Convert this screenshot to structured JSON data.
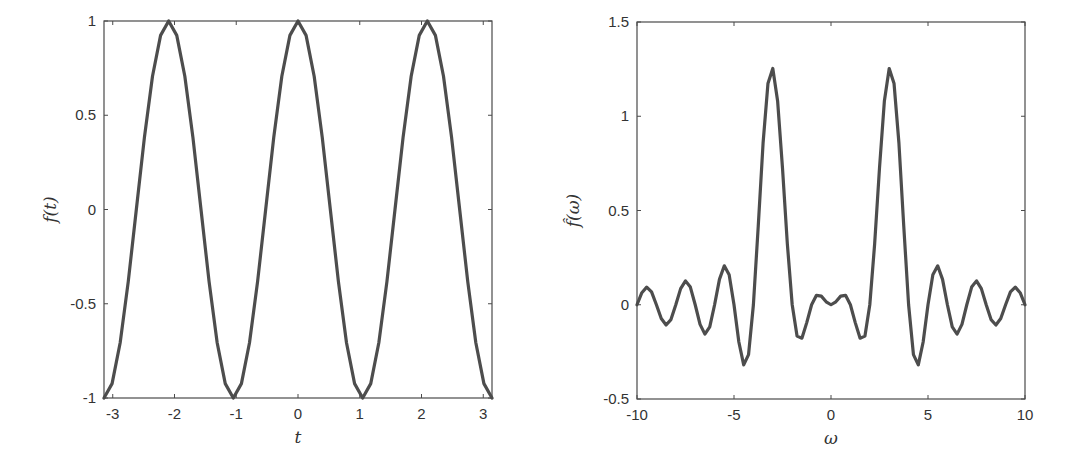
{
  "chart_data": [
    {
      "type": "line",
      "title": "",
      "xlabel": "t",
      "ylabel": "f(t)",
      "xlim": [
        -3.14159,
        3.14159
      ],
      "ylim": [
        -1,
        1
      ],
      "grid": false,
      "xticks": [
        -3,
        -2,
        -1,
        0,
        1,
        2,
        3
      ],
      "xtick_labels": [
        "-3",
        "-2",
        "-1",
        "0",
        "1",
        "2",
        "3"
      ],
      "yticks": [
        -1,
        -0.5,
        0,
        0.5,
        1
      ],
      "ytick_labels": [
        "-1",
        "-0.5",
        "0",
        "0.5",
        "1"
      ],
      "series": [
        {
          "name": "f(t) = cos(3t)",
          "color": "#4d4d4d",
          "x": [
            -3.1416,
            -3.0107,
            -2.8798,
            -2.7489,
            -2.618,
            -2.4871,
            -2.3562,
            -2.2253,
            -2.0944,
            -1.9635,
            -1.8326,
            -1.7017,
            -1.5708,
            -1.4399,
            -1.309,
            -1.1781,
            -1.0472,
            -0.9163,
            -0.7854,
            -0.6545,
            -0.5236,
            -0.3927,
            -0.2618,
            -0.1309,
            0.0,
            0.1309,
            0.2618,
            0.3927,
            0.5236,
            0.6545,
            0.7854,
            0.9163,
            1.0472,
            1.1781,
            1.309,
            1.4399,
            1.5708,
            1.7017,
            1.8326,
            1.9635,
            2.0944,
            2.2253,
            2.3562,
            2.4871,
            2.618,
            2.7489,
            2.8798,
            3.0107,
            3.1416
          ],
          "values": [
            -1,
            -0.9239,
            -0.7071,
            -0.3827,
            0,
            0.3827,
            0.7071,
            0.9239,
            1,
            0.9239,
            0.7071,
            0.3827,
            0,
            -0.3827,
            -0.7071,
            -0.9239,
            -1,
            -0.9239,
            -0.7071,
            -0.3827,
            0,
            0.3827,
            0.7071,
            0.9239,
            1,
            0.9239,
            0.7071,
            0.3827,
            0,
            -0.3827,
            -0.7071,
            -0.9239,
            -1,
            -0.9239,
            -0.7071,
            -0.3827,
            0,
            0.3827,
            0.7071,
            0.9239,
            1,
            0.9239,
            0.7071,
            0.3827,
            0,
            -0.3827,
            -0.7071,
            -0.9239,
            -1
          ]
        }
      ]
    },
    {
      "type": "line",
      "title": "",
      "xlabel": "ω",
      "ylabel": "f̂(ω)",
      "xlim": [
        -10,
        10
      ],
      "ylim": [
        -0.5,
        1.5
      ],
      "grid": false,
      "xticks": [
        -10,
        -5,
        0,
        5,
        10
      ],
      "xtick_labels": [
        "-10",
        "-5",
        "0",
        "5",
        "10"
      ],
      "yticks": [
        -0.5,
        0,
        0.5,
        1,
        1.5
      ],
      "ytick_labels": [
        "-0.5",
        "0",
        "0.5",
        "1",
        "1.5"
      ],
      "series": [
        {
          "name": "Fourier transform f̂(ω)",
          "color": "#4d4d4d",
          "x": [
            -10,
            -9.75,
            -9.5,
            -9.25,
            -9,
            -8.75,
            -8.5,
            -8.25,
            -8,
            -7.75,
            -7.5,
            -7.25,
            -7,
            -6.75,
            -6.5,
            -6.25,
            -6,
            -5.75,
            -5.5,
            -5.25,
            -5,
            -4.75,
            -4.5,
            -4.25,
            -4,
            -3.75,
            -3.5,
            -3.25,
            -3,
            -2.75,
            -2.5,
            -2.25,
            -2,
            -1.75,
            -1.5,
            -1.25,
            -1,
            -0.75,
            -0.5,
            -0.25,
            0,
            0.25,
            0.5,
            0.75,
            1,
            1.25,
            1.5,
            1.75,
            2,
            2.25,
            2.5,
            2.75,
            3,
            3.25,
            3.5,
            3.75,
            4,
            4.25,
            4.5,
            4.75,
            5,
            5.25,
            5.5,
            5.75,
            6,
            6.25,
            6.5,
            6.75,
            7,
            7.25,
            7.5,
            7.75,
            8,
            8.25,
            8.5,
            8.75,
            9,
            9.25,
            9.5,
            9.75,
            10
          ],
          "values": [
            0,
            0.0639,
            0.0933,
            0.0682,
            0,
            -0.0731,
            -0.1072,
            -0.0788,
            0,
            0.0856,
            0.1267,
            0.0939,
            0,
            -0.1042,
            -0.156,
            -0.1173,
            0,
            0.1348,
            0.2065,
            0.1596,
            0,
            -0.1976,
            -0.3191,
            -0.2646,
            0,
            0.4179,
            0.8594,
            1.1736,
            1.2533,
            1.0794,
            0.7254,
            0.3224,
            0,
            -0.1663,
            -0.1773,
            -0.0948,
            0,
            0.0501,
            0.0456,
            0.0158,
            0,
            0.0158,
            0.0456,
            0.0501,
            0,
            -0.0948,
            -0.1773,
            -0.1663,
            0,
            0.3224,
            0.7254,
            1.0794,
            1.2533,
            1.1736,
            0.8594,
            0.4179,
            0,
            -0.2646,
            -0.3191,
            -0.1976,
            0,
            0.1596,
            0.2065,
            0.1348,
            0,
            -0.1173,
            -0.156,
            -0.1042,
            0,
            0.0939,
            0.1267,
            0.0856,
            0,
            -0.0788,
            -0.1072,
            -0.0731,
            0,
            0.0682,
            0.0933,
            0.0639,
            0
          ]
        }
      ]
    }
  ],
  "layout": {
    "panels": [
      {
        "left": 104,
        "top": 21,
        "right": 492,
        "bottom": 398
      },
      {
        "left": 637,
        "top": 22,
        "right": 1025,
        "bottom": 399
      }
    ]
  }
}
